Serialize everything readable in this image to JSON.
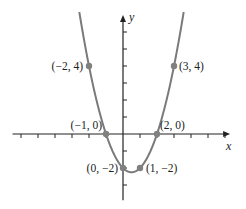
{
  "chart_data": {
    "type": "line",
    "title": "",
    "function": "y = x^2 - x - 2",
    "xlabel": "x",
    "ylabel": "y",
    "xlim": [
      -6.5,
      6.3
    ],
    "ylim": [
      -3.9,
      7.0
    ],
    "grid": false,
    "legend": null,
    "x_ticks": [
      -6,
      -5,
      -4,
      -3,
      -2,
      -1,
      1,
      2,
      3,
      4,
      5,
      6
    ],
    "y_ticks": [
      -3,
      -2,
      -1,
      1,
      2,
      3,
      4,
      5,
      6
    ],
    "points": [
      {
        "x": -2,
        "y": 4,
        "label": "(−2, 4)"
      },
      {
        "x": 3,
        "y": 4,
        "label": "(3, 4)"
      },
      {
        "x": -1,
        "y": 0,
        "label": "(−1, 0)"
      },
      {
        "x": 2,
        "y": 0,
        "label": "(2, 0)"
      },
      {
        "x": 0,
        "y": -2,
        "label": "(0, −2)"
      },
      {
        "x": 1,
        "y": -2,
        "label": "(1, −2)"
      }
    ]
  },
  "style": {
    "curve_color": "#7a7a7a",
    "point_color": "#808080",
    "axis_color": "#222222"
  },
  "layout": {
    "origin_px": [
      123,
      134
    ],
    "unit_px": 17
  }
}
